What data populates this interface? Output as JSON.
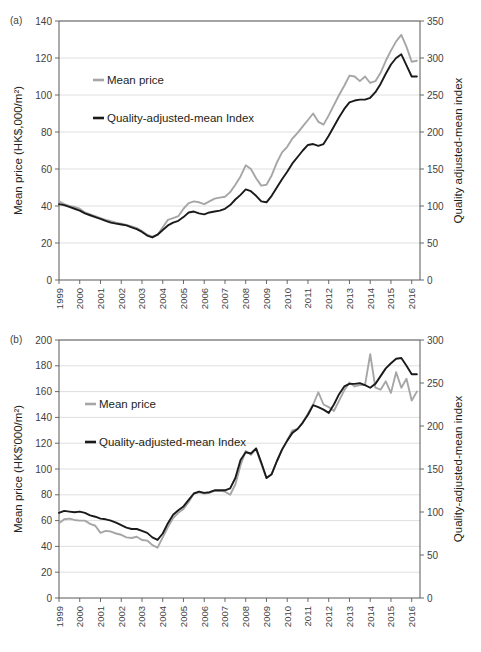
{
  "figure": {
    "panels": [
      {
        "id": "a",
        "label": "(a)",
        "ylabel_left": "Mean price (HK$,000/m²)",
        "ylabel_right": "Quality adjusted-mean index"
      },
      {
        "id": "b",
        "label": "(b)",
        "ylabel_left": "Mean price (HK$'000/m²)",
        "ylabel_right": "Quality-adjusted-mean index"
      }
    ]
  },
  "chart_data": [
    {
      "type": "line",
      "panel": "a",
      "title": "",
      "xlabel": "",
      "ylabel": "Mean price (HK$,000/m²)",
      "ylabel_secondary": "Quality adjusted-mean index",
      "grid": true,
      "legend_position": "upper-left-inside",
      "xlim": [
        1999,
        2016.4
      ],
      "ylim": [
        0,
        140
      ],
      "ylim_secondary": [
        0,
        350
      ],
      "yticks": [
        0,
        20,
        40,
        60,
        80,
        100,
        120,
        140
      ],
      "yticks_secondary": [
        0,
        50,
        100,
        150,
        200,
        250,
        300,
        350
      ],
      "xticks": [
        1999,
        2000,
        2001,
        2002,
        2003,
        2004,
        2005,
        2006,
        2007,
        2008,
        2009,
        2010,
        2011,
        2012,
        2013,
        2014,
        2015,
        2016
      ],
      "x": [
        1999.0,
        1999.25,
        1999.5,
        1999.75,
        2000.0,
        2000.25,
        2000.5,
        2000.75,
        2001.0,
        2001.25,
        2001.5,
        2001.75,
        2002.0,
        2002.25,
        2002.5,
        2002.75,
        2003.0,
        2003.25,
        2003.5,
        2003.75,
        2004.0,
        2004.25,
        2004.5,
        2004.75,
        2005.0,
        2005.25,
        2005.5,
        2005.75,
        2006.0,
        2006.25,
        2006.5,
        2006.75,
        2007.0,
        2007.25,
        2007.5,
        2007.75,
        2008.0,
        2008.25,
        2008.5,
        2008.75,
        2009.0,
        2009.25,
        2009.5,
        2009.75,
        2010.0,
        2010.25,
        2010.5,
        2010.75,
        2011.0,
        2011.25,
        2011.5,
        2011.75,
        2012.0,
        2012.25,
        2012.5,
        2012.75,
        2013.0,
        2013.25,
        2013.5,
        2013.75,
        2014.0,
        2014.25,
        2014.5,
        2014.75,
        2015.0,
        2015.25,
        2015.5,
        2015.75,
        2016.0,
        2016.25
      ],
      "series": [
        {
          "name": "Mean price",
          "color": "#a6a6a6",
          "values": [
            42.5,
            41.0,
            40.0,
            39.5,
            38.5,
            36.5,
            35.5,
            34.5,
            33.5,
            32.5,
            31.8,
            31.0,
            30.5,
            29.8,
            29.0,
            28.0,
            26.5,
            24.5,
            23.5,
            24.5,
            28.5,
            32.5,
            33.5,
            34.5,
            38.5,
            41.5,
            42.5,
            42.0,
            41.0,
            42.5,
            44.0,
            44.5,
            45.0,
            47.5,
            51.5,
            56.0,
            62.0,
            60.0,
            55.0,
            51.0,
            51.5,
            56.5,
            63.5,
            69.0,
            72.0,
            76.5,
            79.5,
            83.0,
            86.5,
            90.0,
            85.5,
            84.0,
            89.0,
            94.5,
            100.0,
            105.0,
            110.5,
            110.0,
            107.5,
            110.0,
            106.5,
            107.5,
            112.0,
            118.5,
            124.0,
            129.0,
            132.5,
            126.0,
            118.0,
            118.5
          ]
        },
        {
          "name": "Quality-adjusted-mean Index",
          "color": "#1a1a1a",
          "values": [
            41.0,
            40.5,
            39.5,
            38.5,
            37.5,
            36.0,
            35.0,
            34.0,
            33.0,
            32.0,
            31.0,
            30.5,
            30.0,
            29.5,
            28.5,
            27.5,
            26.0,
            24.0,
            23.0,
            24.5,
            27.0,
            29.5,
            31.0,
            32.0,
            34.0,
            36.5,
            37.0,
            36.0,
            35.5,
            36.5,
            37.0,
            37.5,
            38.5,
            40.5,
            43.5,
            46.0,
            49.0,
            48.0,
            45.5,
            42.5,
            42.0,
            45.5,
            50.0,
            54.5,
            58.5,
            63.0,
            66.5,
            70.0,
            73.0,
            73.5,
            72.5,
            73.5,
            78.0,
            83.0,
            88.0,
            92.5,
            96.0,
            97.0,
            97.5,
            97.5,
            98.5,
            101.5,
            106.0,
            111.5,
            116.5,
            120.0,
            122.0,
            116.0,
            110.0,
            110.0
          ]
        }
      ]
    },
    {
      "type": "line",
      "panel": "b",
      "title": "",
      "xlabel": "",
      "ylabel": "Mean price (HK$'000/m²)",
      "ylabel_secondary": "Quality-adjusted-mean index",
      "grid": true,
      "legend_position": "upper-left-inside",
      "xlim": [
        1999,
        2016.4
      ],
      "ylim": [
        0,
        200
      ],
      "ylim_secondary": [
        0,
        300
      ],
      "yticks": [
        0,
        20,
        40,
        60,
        80,
        100,
        120,
        140,
        160,
        180,
        200
      ],
      "yticks_secondary": [
        0,
        50,
        100,
        150,
        200,
        250,
        300
      ],
      "xticks": [
        1999,
        2000,
        2001,
        2002,
        2003,
        2004,
        2005,
        2006,
        2007,
        2008,
        2009,
        2010,
        2011,
        2012,
        2013,
        2014,
        2015,
        2016
      ],
      "x": [
        1999.0,
        1999.25,
        1999.5,
        1999.75,
        2000.0,
        2000.25,
        2000.5,
        2000.75,
        2001.0,
        2001.25,
        2001.5,
        2001.75,
        2002.0,
        2002.25,
        2002.5,
        2002.75,
        2003.0,
        2003.25,
        2003.5,
        2003.75,
        2004.0,
        2004.25,
        2004.5,
        2004.75,
        2005.0,
        2005.25,
        2005.5,
        2005.75,
        2006.0,
        2006.25,
        2006.5,
        2006.75,
        2007.0,
        2007.25,
        2007.5,
        2007.75,
        2008.0,
        2008.25,
        2008.5,
        2008.75,
        2009.0,
        2009.25,
        2009.5,
        2009.75,
        2010.0,
        2010.25,
        2010.5,
        2010.75,
        2011.0,
        2011.25,
        2011.5,
        2011.75,
        2012.0,
        2012.25,
        2012.5,
        2012.75,
        2013.0,
        2013.25,
        2013.5,
        2013.75,
        2014.0,
        2014.25,
        2014.5,
        2014.75,
        2015.0,
        2015.25,
        2015.5,
        2015.75,
        2016.0,
        2016.25
      ],
      "series": [
        {
          "name": "Mean price",
          "color": "#a6a6a6",
          "values": [
            58.0,
            61.0,
            61.5,
            60.5,
            60.0,
            60.0,
            57.5,
            56.0,
            50.5,
            52.0,
            51.5,
            50.0,
            49.0,
            47.0,
            46.5,
            47.5,
            45.0,
            44.5,
            41.0,
            39.0,
            47.0,
            55.0,
            62.0,
            66.0,
            69.0,
            74.5,
            81.0,
            82.0,
            81.0,
            81.5,
            83.0,
            83.0,
            82.5,
            80.0,
            88.0,
            103.0,
            114.0,
            111.0,
            115.5,
            104.0,
            93.0,
            96.0,
            106.0,
            115.0,
            122.0,
            130.0,
            131.0,
            136.0,
            143.0,
            150.0,
            159.5,
            150.0,
            148.0,
            145.0,
            153.0,
            161.0,
            167.0,
            164.0,
            165.0,
            165.0,
            189.0,
            163.0,
            161.5,
            168.0,
            159.0,
            175.0,
            163.0,
            170.0,
            153.0,
            160.0
          ]
        },
        {
          "name": "Quality-adjusted-mean Index",
          "color": "#1a1a1a",
          "values": [
            66.0,
            67.5,
            67.0,
            66.5,
            67.0,
            66.0,
            64.0,
            63.0,
            61.5,
            61.0,
            60.0,
            58.5,
            56.5,
            54.5,
            53.5,
            53.5,
            52.0,
            50.5,
            47.0,
            45.0,
            50.0,
            58.0,
            64.5,
            68.0,
            71.0,
            76.0,
            81.0,
            82.5,
            81.5,
            82.0,
            83.5,
            83.5,
            83.5,
            85.0,
            93.0,
            107.0,
            113.0,
            112.0,
            116.0,
            105.0,
            93.0,
            96.0,
            106.0,
            115.0,
            122.0,
            128.0,
            131.0,
            136.0,
            142.0,
            149.5,
            148.0,
            146.0,
            143.5,
            150.0,
            158.0,
            164.0,
            166.0,
            166.0,
            166.5,
            165.0,
            163.0,
            166.0,
            172.0,
            178.0,
            182.0,
            185.5,
            186.0,
            180.0,
            173.5,
            173.5
          ]
        }
      ]
    }
  ]
}
